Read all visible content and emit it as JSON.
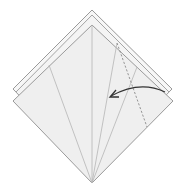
{
  "diagram": {
    "type": "origami-step",
    "colors": {
      "paper_fill": "#efefef",
      "paper_back_fill": "#f6f6f6",
      "edge": "#9a9a9a",
      "crease": "#b5b5b5",
      "dashed_fold": "#8a8a8a",
      "arrow": "#333333",
      "background": "#ffffff"
    },
    "layers": {
      "back_outer": {
        "top": [
          92,
          10
        ],
        "left": [
          13,
          89
        ],
        "right": [
          172,
          89
        ]
      },
      "back_inner": {
        "top": [
          92,
          15
        ],
        "left": [
          16,
          92
        ],
        "right": [
          169,
          92
        ]
      },
      "front": {
        "top": [
          92,
          25
        ],
        "left": [
          13,
          101
        ],
        "right": [
          173,
          101
        ],
        "bottom": [
          92,
          183
        ]
      }
    },
    "creases": [
      {
        "from": [
          92,
          183
        ],
        "to": [
          49,
          65
        ]
      },
      {
        "from": [
          92,
          183
        ],
        "to": [
          92,
          25
        ]
      },
      {
        "from": [
          92,
          183
        ],
        "to": [
          117,
          43
        ]
      },
      {
        "from": [
          92,
          183
        ],
        "to": [
          137,
          67
        ]
      }
    ],
    "fold_line": {
      "style": "dashed",
      "from": [
        117,
        43
      ],
      "to": [
        147,
        127
      ]
    },
    "arrow": {
      "from": [
        165,
        92
      ],
      "control": [
        140,
        80
      ],
      "to": [
        110,
        97
      ],
      "head": "open"
    }
  }
}
